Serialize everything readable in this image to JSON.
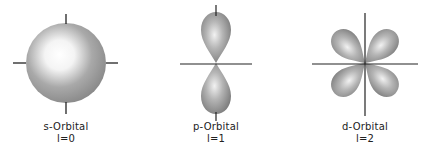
{
  "orbitals": [
    {
      "name": "s-Orbital",
      "quantum": "l=0",
      "center": [
        66,
        63
      ]
    },
    {
      "name": "p-Orbital",
      "quantum": "l=1",
      "center": [
        216,
        63
      ]
    },
    {
      "name": "d-Orbital",
      "quantum": "l=2",
      "center": [
        365,
        63
      ]
    }
  ],
  "colors": {
    "background": "#ffffff",
    "axis": "#222222",
    "lobe_light": "#ffffff",
    "lobe_dark": "#7a7a7a"
  }
}
